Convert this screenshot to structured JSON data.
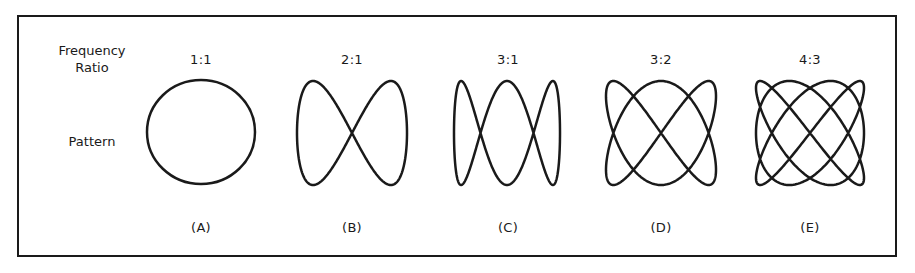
{
  "row_labels": {
    "frequency_ratio_line1": "Frequency",
    "frequency_ratio_line2": "Ratio",
    "pattern": "Pattern"
  },
  "patterns": [
    {
      "id": "A",
      "ratio": "1:1",
      "label": "(A)",
      "x_freq": 1,
      "y_freq": 1,
      "shape": "circle"
    },
    {
      "id": "B",
      "ratio": "2:1",
      "label": "(B)",
      "x_freq": 1,
      "y_freq": 2,
      "shape": "lissajous"
    },
    {
      "id": "C",
      "ratio": "3:1",
      "label": "(C)",
      "x_freq": 1,
      "y_freq": 3,
      "shape": "lissajous"
    },
    {
      "id": "D",
      "ratio": "3:2",
      "label": "(D)",
      "x_freq": 2,
      "y_freq": 3,
      "shape": "lissajous"
    },
    {
      "id": "E",
      "ratio": "4:3",
      "label": "(E)",
      "x_freq": 3,
      "y_freq": 4,
      "shape": "lissajous"
    }
  ],
  "colors": {
    "stroke": "#1a1a1a",
    "background": "#ffffff"
  }
}
